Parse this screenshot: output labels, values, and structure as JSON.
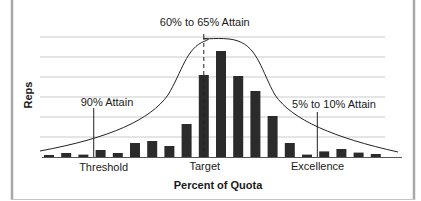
{
  "chart_data": {
    "type": "bar",
    "title": "",
    "xlabel": "Percent of Quota",
    "ylabel": "Reps",
    "ylim": [
      0,
      6
    ],
    "grid": true,
    "gridlines": 6,
    "bar_color": "#2b2b2b",
    "grid_color": "#bdbdbd",
    "border_color": "#a8a8a8",
    "categories": [
      "1",
      "2",
      "3",
      "4",
      "5",
      "6",
      "7",
      "8",
      "9",
      "10",
      "11",
      "12",
      "13",
      "14",
      "15",
      "16",
      "17",
      "18",
      "19",
      "20"
    ],
    "values": [
      0.1,
      0.2,
      0.12,
      0.35,
      0.2,
      0.7,
      0.8,
      0.55,
      1.65,
      4.1,
      5.3,
      4.05,
      3.3,
      2.05,
      0.7,
      0.12,
      0.28,
      0.4,
      0.22,
      0.15
    ],
    "x_tick_labels": [
      {
        "label": "Threshold",
        "at_bar": 4
      },
      {
        "label": "Target",
        "at_bar": 10
      },
      {
        "label": "Excellence",
        "at_bar": 16.5
      }
    ],
    "curve": {
      "type": "bell",
      "description": "Attainment distribution curve",
      "peak_value": 5.9
    },
    "annotations": [
      {
        "text": "60% to 65% Attain",
        "at_bar": 10,
        "style": "dashed-through-peak"
      },
      {
        "text": "90% Attain",
        "at_bar": 3.6,
        "style": "leader-line"
      },
      {
        "text": "5% to 10% Attain",
        "at_bar": 16.6,
        "style": "leader-line"
      }
    ],
    "legend": "none"
  }
}
